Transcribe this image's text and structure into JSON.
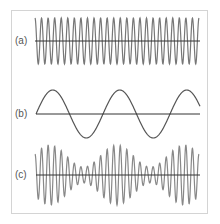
{
  "figure": {
    "panels": [
      {
        "label": "(a)",
        "description": "high-frequency carrier sine wave",
        "cycles": 25
      },
      {
        "label": "(b)",
        "description": "low-frequency modulating sine wave",
        "cycles": 2.45
      },
      {
        "label": "(c)",
        "description": "amplitude-modulated (beat) waveform"
      }
    ],
    "colors": {
      "wave": "#777777",
      "axis": "#333333",
      "frame": "#d4d4d4"
    }
  }
}
